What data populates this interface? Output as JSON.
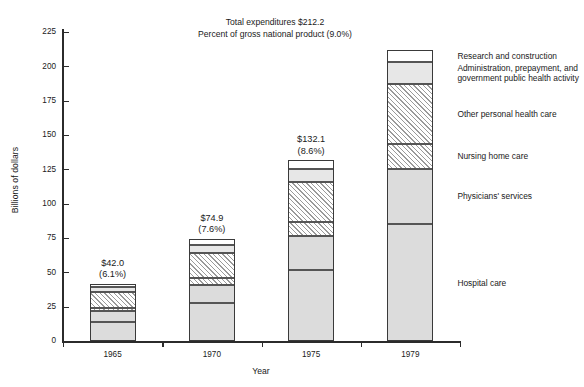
{
  "chart_data": {
    "type": "bar",
    "subtype": "stacked-bar",
    "title": "",
    "header_lines": [
      "Total expenditures $212.2",
      "Percent of gross national product (9.0%)"
    ],
    "xlabel": "Year",
    "ylabel": "Billions of dollars",
    "categories": [
      "1965",
      "1970",
      "1975",
      "1979"
    ],
    "ylim": [
      0,
      225
    ],
    "yticks": [
      0,
      25,
      50,
      75,
      100,
      125,
      150,
      175,
      200,
      225
    ],
    "ytick_labels": [
      "0",
      "25",
      "50",
      "75",
      "100",
      "125",
      "150",
      "175",
      "200",
      "225"
    ],
    "grid": false,
    "legend_position": "right",
    "totals": [
      42.0,
      74.9,
      132.1,
      212.2
    ],
    "total_labels": [
      "$42.0",
      "$74.9",
      "$132.1",
      ""
    ],
    "percent_labels": [
      "(6.1%)",
      "(7.6%)",
      "(8.6%)",
      "(9.0%)"
    ],
    "series": [
      {
        "name": "Hospital care",
        "fill": "gray",
        "values": [
          13.9,
          27.8,
          52.1,
          85.3
        ]
      },
      {
        "name": "Physicians' services",
        "fill": "gray",
        "values": [
          8.5,
          13.6,
          24.9,
          40.6
        ]
      },
      {
        "name": "Nursing home care",
        "fill": "hatch",
        "values": [
          2.1,
          4.7,
          10.1,
          17.8
        ]
      },
      {
        "name": "Other personal health care",
        "fill": "hatch",
        "values": [
          11.4,
          18.1,
          28.9,
          43.5
        ]
      },
      {
        "name": "Administration, prepayment, and government public health activity",
        "fill": "light-gray",
        "values": [
          3.6,
          6.4,
          9.6,
          16.0
        ]
      },
      {
        "name": "Research and construction",
        "fill": "white",
        "values": [
          2.5,
          4.3,
          6.5,
          9.0
        ]
      }
    ]
  },
  "legend": {
    "items": [
      {
        "label_line1": "Research and construction",
        "label_line2": "",
        "fill": "white"
      },
      {
        "label_line1": "Administration, prepayment, and",
        "label_line2": "government public health activity",
        "fill": "light-gray"
      },
      {
        "label_line1": "Other personal health care",
        "label_line2": "",
        "fill": "hatch"
      },
      {
        "label_line1": "Nursing home care",
        "label_line2": "",
        "fill": "hatch"
      },
      {
        "label_line1": "Physicians' services",
        "label_line2": "",
        "fill": "gray"
      },
      {
        "label_line1": "Hospital care",
        "label_line2": "",
        "fill": "gray"
      }
    ]
  },
  "colors": {
    "axis": "#2b2b2b",
    "segment_border": "#555555",
    "fill_gray": "#dcdcdc",
    "fill_light_gray": "#e7e7e7",
    "fill_white": "#ffffff",
    "text": "#1a1a1a"
  }
}
